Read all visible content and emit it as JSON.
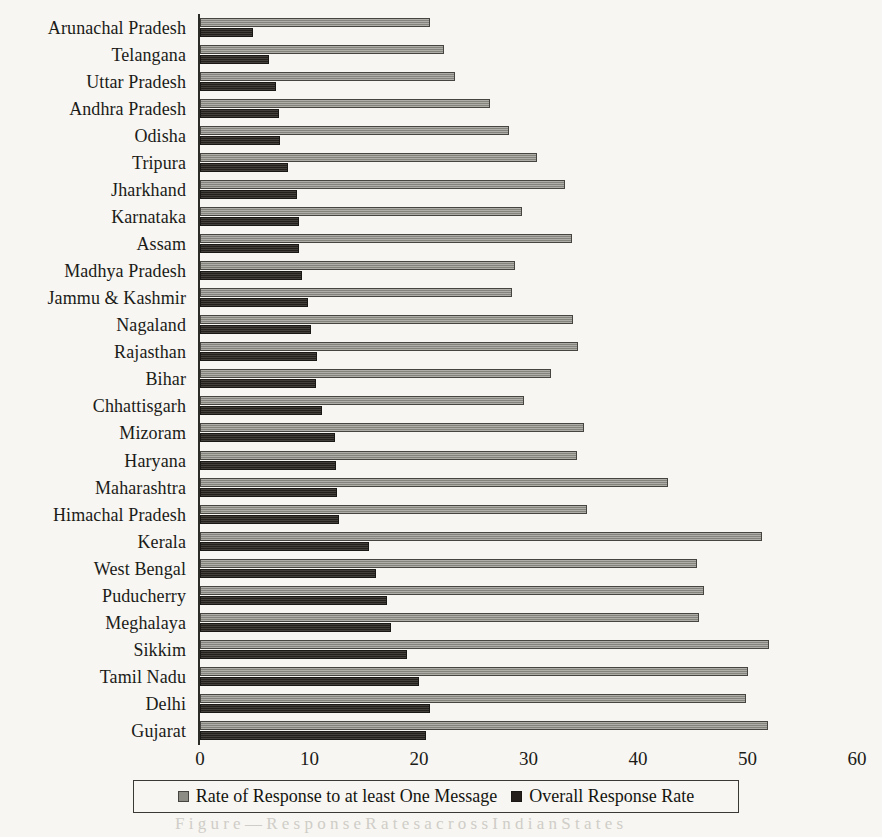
{
  "chart_data": {
    "type": "bar",
    "orientation": "horizontal",
    "title": "",
    "xlabel": "",
    "ylabel": "",
    "xlim": [
      0,
      60
    ],
    "xticks": [
      "0",
      "10",
      "20",
      "30",
      "40",
      "50",
      "60"
    ],
    "grid": false,
    "legend_position": "bottom",
    "categories": [
      "Arunachal Pradesh",
      "Telangana",
      "Uttar Pradesh",
      "Andhra Pradesh",
      "Odisha",
      "Tripura",
      "Jharkhand",
      "Karnataka",
      "Assam",
      "Madhya Pradesh",
      "Jammu & Kashmir",
      "Nagaland",
      "Rajasthan",
      "Bihar",
      "Chhattisgarh",
      "Mizoram",
      "Haryana",
      "Maharashtra",
      "Himachal Pradesh",
      "Kerala",
      "West Bengal",
      "Puducherry",
      "Meghalaya",
      "Sikkim",
      "Tamil Nadu",
      "Delhi",
      "Gujarat"
    ],
    "series": [
      {
        "name": "Rate of Response to at least One Message",
        "color": "#8c8b84",
        "values": [
          21.0,
          22.3,
          23.3,
          26.5,
          28.2,
          30.8,
          33.3,
          29.4,
          34.0,
          28.8,
          28.5,
          34.1,
          34.5,
          32.1,
          29.6,
          35.1,
          34.4,
          42.7,
          35.3,
          51.3,
          45.4,
          46.0,
          45.6,
          52.0,
          50.0,
          49.9,
          51.9
        ]
      },
      {
        "name": "Overall Response Rate",
        "color": "#2e2a25",
        "values": [
          4.8,
          6.3,
          6.9,
          7.2,
          7.3,
          8.0,
          8.9,
          9.0,
          9.0,
          9.3,
          9.9,
          10.1,
          10.7,
          10.6,
          11.1,
          12.3,
          12.4,
          12.5,
          12.7,
          15.4,
          16.1,
          17.1,
          17.4,
          18.9,
          20.0,
          21.0,
          20.6
        ]
      }
    ]
  },
  "legend": {
    "entries": [
      {
        "label": "Rate of Response to at least One Message",
        "style": "light"
      },
      {
        "label": "Overall Response Rate",
        "style": "dark"
      }
    ]
  },
  "caption": {
    "text": "F i g u r e   —   R e s p o n s e   R a t e s   a c r o s s   I n d i a n   S t a t e s"
  },
  "colors": {
    "light_series": "#8c8b84",
    "dark_series": "#2e2a25",
    "axis": "#2b2b28",
    "background": "#f7f6f2",
    "text": "#1b1b18"
  }
}
